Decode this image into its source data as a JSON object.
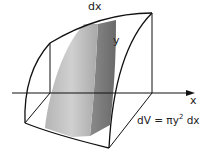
{
  "diagram": {
    "type": "solid-of-revolution",
    "labels": {
      "dx": "dx",
      "y": "y",
      "x_axis": "x",
      "formula_lhs": "dV = ",
      "formula_pi": "π",
      "formula_y": "y",
      "formula_exp": "2",
      "formula_rest": " dx"
    },
    "colors": {
      "outline": "#111111",
      "slab_light": "#c8c8c8",
      "slab_mid": "#9a9a9a",
      "slab_dark": "#6e6e6e"
    }
  }
}
